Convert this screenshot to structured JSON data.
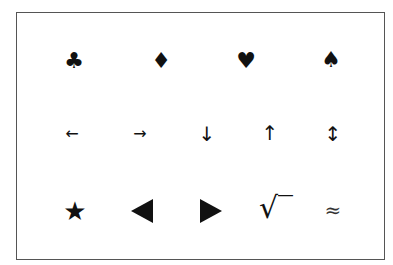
{
  "symbol_table": {
    "row1": [
      {
        "name": "club",
        "glyph": "♣"
      },
      {
        "name": "diamond",
        "glyph": "♦"
      },
      {
        "name": "heart",
        "glyph": "♥"
      },
      {
        "name": "spade",
        "glyph": "♠"
      }
    ],
    "row2": [
      {
        "name": "left-arrow",
        "glyph": "←"
      },
      {
        "name": "right-arrow",
        "glyph": "→"
      },
      {
        "name": "down-arrow",
        "glyph": "↓"
      },
      {
        "name": "up-arrow",
        "glyph": "↑"
      },
      {
        "name": "up-down-arrow",
        "glyph": "↕"
      }
    ],
    "row3": [
      {
        "name": "star",
        "glyph": "★"
      },
      {
        "name": "left-triangle",
        "glyph": "◀"
      },
      {
        "name": "right-triangle",
        "glyph": "▶"
      },
      {
        "name": "square-root",
        "glyph": "√‾"
      },
      {
        "name": "approximately-equal",
        "glyph": "≈"
      }
    ]
  }
}
